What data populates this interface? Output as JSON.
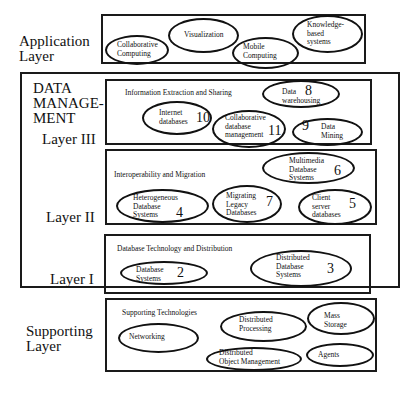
{
  "layers": {
    "application": {
      "label_line1": "Application",
      "label_line2": "Layer"
    },
    "data_management": {
      "label_line1": "DATA",
      "label_line2": "MANAGE-",
      "label_line3": "MENT"
    },
    "layer3": {
      "label": "Layer III"
    },
    "layer2": {
      "label": "Layer II"
    },
    "layer1": {
      "label": "Layer I"
    },
    "supporting": {
      "label_line1": "Supporting",
      "label_line2": "Layer"
    }
  },
  "application_items": [
    {
      "text": "Collaborative\nComputing"
    },
    {
      "text": "Visualization"
    },
    {
      "text": "Mobile\nComputing"
    },
    {
      "text": "Knowledge-\nbased\nsystems"
    }
  ],
  "layer3_section": {
    "title": "Information Extraction and Sharing",
    "items": [
      {
        "text": "Data\nwarehousing",
        "number": "8"
      },
      {
        "text": "Internet\ndatabases",
        "number": "10"
      },
      {
        "text": "Collaborative\ndatabase\nmanagement",
        "number": "11"
      },
      {
        "text": "Data\nMining",
        "number": "9"
      }
    ]
  },
  "layer2_section": {
    "title": "Interoperability and Migration",
    "items": [
      {
        "text": "Multimedia\nDatabase\nSystems",
        "number": "6"
      },
      {
        "text": "Heterogeneous\nDatabase\nSystems",
        "number": "4"
      },
      {
        "text": "Migrating\nLegacy\nDatabases",
        "number": "7"
      },
      {
        "text": "Client\nserver\ndatabases",
        "number": "5"
      }
    ]
  },
  "layer1_section": {
    "title": "Database Technology and Distribution",
    "items": [
      {
        "text": "Database\nSystems",
        "number": "2"
      },
      {
        "text": "Distributed\nDatabase\nSystems",
        "number": "3"
      }
    ]
  },
  "supporting_section": {
    "title": "Supporting Technologies",
    "items": [
      {
        "text": "Networking"
      },
      {
        "text": "Distributed\nProcessing"
      },
      {
        "text": "Mass\nStorage"
      },
      {
        "text": "Distributed\nObject Management"
      },
      {
        "text": "Agents"
      }
    ]
  }
}
